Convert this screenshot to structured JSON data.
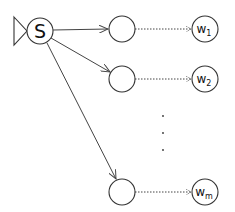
{
  "diagram": {
    "source": {
      "label": "S",
      "cx": 40,
      "cy": 31,
      "r": 13
    },
    "source_marker": {
      "shape": "triangle",
      "points": "14,17 27,31 14,45"
    },
    "middle_nodes": [
      {
        "id": "m1",
        "cx": 122,
        "cy": 29,
        "r": 13
      },
      {
        "id": "m2",
        "cx": 122,
        "cy": 79,
        "r": 13
      },
      {
        "id": "m3",
        "cx": 122,
        "cy": 192,
        "r": 13
      }
    ],
    "targets": [
      {
        "id": "w1",
        "base": "w",
        "sub": "1",
        "cx": 205,
        "cy": 29,
        "r": 13
      },
      {
        "id": "w2",
        "base": "w",
        "sub": "2",
        "cx": 205,
        "cy": 79,
        "r": 13
      },
      {
        "id": "wm",
        "base": "w",
        "sub": "m",
        "cx": 205,
        "cy": 192,
        "r": 13
      }
    ],
    "edges": [
      {
        "from": "S",
        "to": "m1",
        "style": "solid-arrow"
      },
      {
        "from": "S",
        "to": "m2",
        "style": "solid-arrow"
      },
      {
        "from": "S",
        "to": "m3",
        "style": "solid-arrow"
      },
      {
        "from": "m1",
        "to": "w1",
        "style": "dotted-arrow"
      },
      {
        "from": "m2",
        "to": "w2",
        "style": "dotted-arrow"
      },
      {
        "from": "m3",
        "to": "wm",
        "style": "dotted-arrow"
      }
    ],
    "ellipsis": {
      "orientation": "vertical",
      "count": 3
    }
  }
}
